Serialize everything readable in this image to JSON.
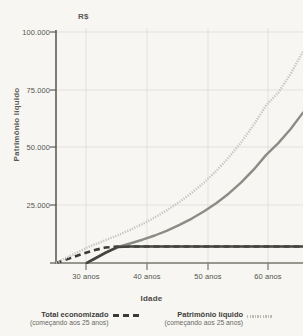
{
  "chart_data": {
    "type": "line",
    "title": "",
    "currency_unit": "R$",
    "xlabel": "Idade",
    "ylabel": "Patrimônio líquido",
    "xlim": [
      25,
      65
    ],
    "ylim": [
      0,
      100000
    ],
    "xtick_labels": [
      "30 anos",
      "40 anos",
      "50 anos",
      "60 anos"
    ],
    "xtick_values": [
      30,
      40,
      50,
      60
    ],
    "ytick_labels": [
      "100.000",
      "75.000",
      "50.000",
      "25.000"
    ],
    "ytick_values": [
      100000,
      75000,
      50000,
      25000
    ],
    "grid": true,
    "legend_position": "bottom",
    "x": [
      25,
      27,
      29,
      30,
      31,
      33,
      35,
      37,
      39,
      41,
      43,
      45,
      47,
      49,
      51,
      53,
      55,
      57,
      59,
      61,
      63,
      65
    ],
    "series": [
      {
        "name": "Total economizado (começando aos 25 anos)",
        "style": "dashed",
        "color": "#3a3a36",
        "values": [
          0,
          1800,
          3600,
          4500,
          5300,
          6600,
          7000,
          7000,
          7000,
          7000,
          7000,
          7000,
          7000,
          7000,
          7000,
          7000,
          7000,
          7000,
          7000,
          7000,
          7000,
          7000
        ]
      },
      {
        "name": "Patrimônio líquido (começando aos 25 anos)",
        "style": "dotted",
        "color": "#c6c6c1",
        "values": [
          0,
          2600,
          5200,
          6500,
          7600,
          9700,
          11800,
          14100,
          16600,
          19400,
          22500,
          26000,
          29900,
          34300,
          39300,
          45000,
          51400,
          58700,
          67000,
          72500,
          80500,
          90000
        ]
      },
      {
        "name": "Patrimônio líquido (começando aos 30 anos)",
        "style": "solid",
        "color": "#8c8c86",
        "values": [
          null,
          null,
          null,
          0,
          1400,
          4400,
          6800,
          8300,
          9900,
          11700,
          13800,
          16200,
          18900,
          22000,
          25500,
          29600,
          34300,
          39700,
          45900,
          51000,
          57000,
          64000
        ]
      },
      {
        "name": "Total economizado (começando aos 30 anos)",
        "style": "solid-dark",
        "color": "#45453f",
        "values": [
          null,
          null,
          null,
          0,
          1500,
          4300,
          6800,
          7000,
          7000,
          7000,
          7000,
          7000,
          7000,
          7000,
          7000,
          7000,
          7000,
          7000,
          7000,
          7000,
          7000,
          7000
        ]
      }
    ],
    "annotations": []
  },
  "legend": {
    "items": [
      {
        "title": "Total economizado",
        "subtitle": "(começando aos 25 anos)",
        "swatch": "dashed-line-swatch"
      },
      {
        "title": "Patrimônio líquido",
        "subtitle": "(começando aos 25 anos)",
        "swatch": "dotted-line-swatch"
      }
    ]
  }
}
